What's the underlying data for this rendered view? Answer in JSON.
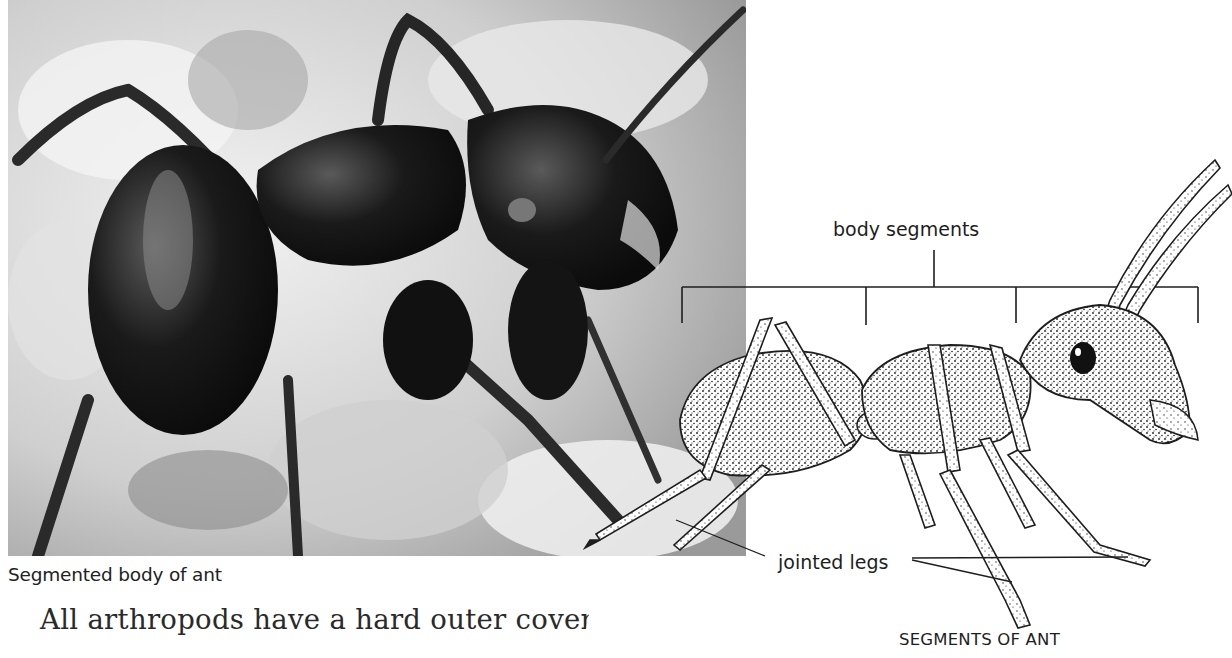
{
  "photo": {
    "caption": "Segmented body of ant",
    "subject": "black ant photograph"
  },
  "body_text": {
    "line1": "All arthropods have a hard outer covering. In",
    "line2": ""
  },
  "diagram": {
    "title": "SEGMENTS OF ANT",
    "labels": {
      "body_segments": "body segments",
      "jointed_legs": "jointed legs"
    },
    "colors": {
      "ink": "#1e1e1e",
      "paper": "#ffffff"
    }
  }
}
